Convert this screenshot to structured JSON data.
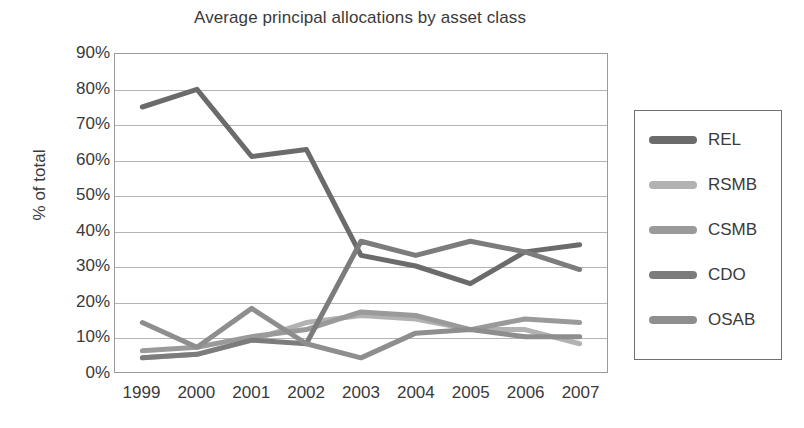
{
  "chart_data": {
    "type": "line",
    "title": "Average principal allocations by asset class",
    "xlabel": "",
    "ylabel": "% of total",
    "grid": true,
    "legend_position": "right",
    "x": [
      "1999",
      "2000",
      "2001",
      "2002",
      "2003",
      "2004",
      "2005",
      "2006",
      "2007"
    ],
    "categories": [
      "1999",
      "2000",
      "2001",
      "2002",
      "2003",
      "2004",
      "2005",
      "2006",
      "2007"
    ],
    "ylim": [
      0,
      90
    ],
    "ytick_labels": [
      "90%",
      "80%",
      "70%",
      "60%",
      "50%",
      "40%",
      "30%",
      "20%",
      "10%",
      "0%"
    ],
    "ytick_values": [
      90,
      80,
      70,
      60,
      50,
      40,
      30,
      20,
      10,
      0
    ],
    "series": [
      {
        "name": "REL",
        "color": "#6b6b6b",
        "values": [
          75,
          80,
          61,
          63,
          33,
          30,
          25,
          34,
          36
        ]
      },
      {
        "name": "RSMB",
        "color": "#b2b2b2",
        "values": [
          4,
          5,
          9,
          14,
          16,
          15,
          12,
          12,
          8
        ]
      },
      {
        "name": "CSMB",
        "color": "#9a9a9a",
        "values": [
          6,
          7,
          10,
          12,
          17,
          16,
          12,
          15,
          14
        ]
      },
      {
        "name": "CDO",
        "color": "#7c7c7c",
        "values": [
          4,
          5,
          9,
          8,
          37,
          33,
          37,
          34,
          29
        ]
      },
      {
        "name": "OSAB",
        "color": "#8e8e8e",
        "values": [
          14,
          7,
          18,
          8,
          4,
          11,
          12,
          10,
          10
        ]
      }
    ]
  },
  "legend": {
    "items": [
      {
        "label": "REL"
      },
      {
        "label": "RSMB"
      },
      {
        "label": "CSMB"
      },
      {
        "label": "CDO"
      },
      {
        "label": "OSAB"
      }
    ]
  }
}
